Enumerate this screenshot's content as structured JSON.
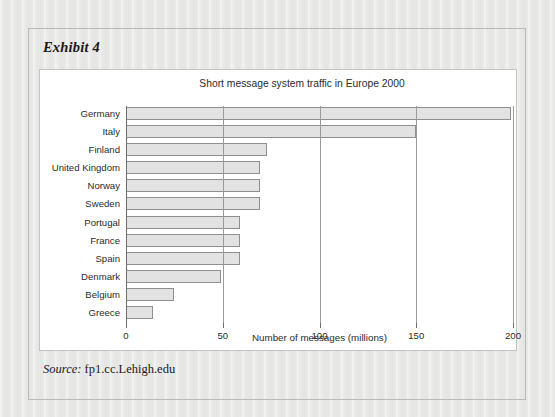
{
  "exhibit": {
    "label": "Exhibit 4",
    "source_keyword": "Source:",
    "source_value": "fp1.cc.Lehigh.edu"
  },
  "chart_data": {
    "type": "bar",
    "orientation": "horizontal",
    "title": "Short message system traffic in Europe 2000",
    "xlabel": "Number of messages (millions)",
    "ylabel": "",
    "xlim": [
      0,
      200
    ],
    "xticks": [
      0,
      50,
      100,
      150,
      200
    ],
    "xtick_labels": [
      "0",
      "50",
      "100",
      "150",
      "200"
    ],
    "grid": true,
    "legend": null,
    "categories": [
      "Germany",
      "Italy",
      "Finland",
      "United Kingdom",
      "Norway",
      "Sweden",
      "Portugal",
      "France",
      "Spain",
      "Denmark",
      "Belgium",
      "Greece"
    ],
    "values": [
      199,
      150,
      73,
      69,
      69,
      69,
      59,
      59,
      59,
      49,
      25,
      14
    ],
    "bar_fill": "#e2e2e2",
    "bar_edge": "#8f8f8f"
  },
  "colors": {
    "page_background": "#e9e9e7",
    "card_background": "#ffffff",
    "frame_border": "#b9b9b7",
    "text": "#2b2b2b",
    "gridline": "#9a9a9a"
  }
}
